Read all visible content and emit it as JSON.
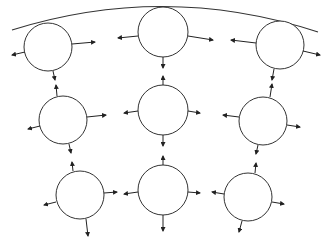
{
  "diagram": {
    "width": 330,
    "height": 247,
    "stroke_color": "#333333",
    "arrow_color": "#222222",
    "background": "#ffffff",
    "boundary_arc": {
      "path": "M 12 30 Q 165 -18 318 32",
      "description": "curved boundary line across the top touching the upper row of circles"
    },
    "circles": [
      {
        "id": "top-left",
        "cx": 48,
        "cy": 47,
        "r": 24,
        "arrows": [
          {
            "x1": 25,
            "y1": 52,
            "x2": 12,
            "y2": 55
          },
          {
            "x1": 72,
            "y1": 44,
            "x2": 95,
            "y2": 42
          },
          {
            "x1": 53,
            "y1": 71,
            "x2": 55,
            "y2": 80
          }
        ]
      },
      {
        "id": "top-middle",
        "cx": 163,
        "cy": 32,
        "r": 25,
        "arrows": [
          {
            "x1": 138,
            "y1": 36,
            "x2": 118,
            "y2": 38
          },
          {
            "x1": 188,
            "y1": 36,
            "x2": 213,
            "y2": 40
          },
          {
            "x1": 163,
            "y1": 57,
            "x2": 163,
            "y2": 68
          }
        ]
      },
      {
        "id": "top-right",
        "cx": 280,
        "cy": 45,
        "r": 24,
        "arrows": [
          {
            "x1": 256,
            "y1": 43,
            "x2": 231,
            "y2": 40
          },
          {
            "x1": 303,
            "y1": 51,
            "x2": 320,
            "y2": 55
          },
          {
            "x1": 274,
            "y1": 69,
            "x2": 272,
            "y2": 80
          }
        ]
      },
      {
        "id": "mid-left",
        "cx": 63,
        "cy": 120,
        "r": 24,
        "arrows": [
          {
            "x1": 57,
            "y1": 96,
            "x2": 56,
            "y2": 85
          },
          {
            "x1": 87,
            "y1": 117,
            "x2": 106,
            "y2": 115
          },
          {
            "x1": 40,
            "y1": 126,
            "x2": 28,
            "y2": 129
          },
          {
            "x1": 69,
            "y1": 144,
            "x2": 71,
            "y2": 153
          }
        ]
      },
      {
        "id": "mid-middle",
        "cx": 163,
        "cy": 110,
        "r": 25,
        "arrows": [
          {
            "x1": 163,
            "y1": 85,
            "x2": 163,
            "y2": 76
          },
          {
            "x1": 138,
            "y1": 111,
            "x2": 124,
            "y2": 113
          },
          {
            "x1": 188,
            "y1": 111,
            "x2": 200,
            "y2": 113
          },
          {
            "x1": 163,
            "y1": 135,
            "x2": 163,
            "y2": 146
          }
        ]
      },
      {
        "id": "mid-right",
        "cx": 263,
        "cy": 121,
        "r": 24,
        "arrows": [
          {
            "x1": 270,
            "y1": 97,
            "x2": 272,
            "y2": 84
          },
          {
            "x1": 239,
            "y1": 117,
            "x2": 223,
            "y2": 115
          },
          {
            "x1": 287,
            "y1": 125,
            "x2": 300,
            "y2": 127
          },
          {
            "x1": 258,
            "y1": 145,
            "x2": 256,
            "y2": 154
          }
        ]
      },
      {
        "id": "bot-left",
        "cx": 80,
        "cy": 195,
        "r": 24,
        "arrows": [
          {
            "x1": 73,
            "y1": 171,
            "x2": 72,
            "y2": 162
          },
          {
            "x1": 104,
            "y1": 193,
            "x2": 117,
            "y2": 192
          },
          {
            "x1": 56,
            "y1": 202,
            "x2": 44,
            "y2": 205
          },
          {
            "x1": 86,
            "y1": 219,
            "x2": 88,
            "y2": 236
          }
        ]
      },
      {
        "id": "bot-middle",
        "cx": 163,
        "cy": 190,
        "r": 25,
        "arrows": [
          {
            "x1": 163,
            "y1": 165,
            "x2": 163,
            "y2": 156
          },
          {
            "x1": 138,
            "y1": 192,
            "x2": 124,
            "y2": 194
          },
          {
            "x1": 188,
            "y1": 192,
            "x2": 200,
            "y2": 193
          },
          {
            "x1": 163,
            "y1": 215,
            "x2": 163,
            "y2": 231
          }
        ]
      },
      {
        "id": "bot-right",
        "cx": 248,
        "cy": 197,
        "r": 24,
        "arrows": [
          {
            "x1": 255,
            "y1": 173,
            "x2": 256,
            "y2": 163
          },
          {
            "x1": 224,
            "y1": 194,
            "x2": 212,
            "y2": 192
          },
          {
            "x1": 272,
            "y1": 202,
            "x2": 284,
            "y2": 204
          },
          {
            "x1": 242,
            "y1": 221,
            "x2": 239,
            "y2": 232
          }
        ]
      }
    ]
  }
}
